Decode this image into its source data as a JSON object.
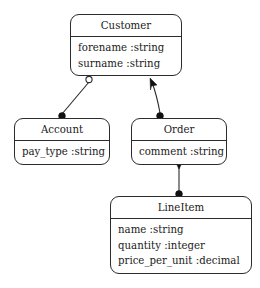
{
  "diagram": {
    "kind": "uml-class-diagram",
    "background_color": "#ffffff",
    "line_color": "#2b2b2b",
    "text_color": "#1a1a1a",
    "classes": [
      {
        "id": "customer",
        "name": "Customer",
        "attributes": [
          "forename :string",
          "surname :string"
        ]
      },
      {
        "id": "account",
        "name": "Account",
        "attributes": [
          "pay_type :string"
        ]
      },
      {
        "id": "order",
        "name": "Order",
        "attributes": [
          "comment :string"
        ]
      },
      {
        "id": "lineitem",
        "name": "LineItem",
        "attributes": [
          "name :string",
          "quantity :integer",
          "price_per_unit :decimal"
        ]
      }
    ],
    "associations": [
      {
        "id": "customer-account",
        "from": "customer",
        "to": "account",
        "from_marker": "hollow-circle",
        "to_marker": "filled-circle"
      },
      {
        "id": "customer-order",
        "from": "customer",
        "to": "order",
        "from_marker": "arrowhead",
        "to_marker": "filled-circle"
      },
      {
        "id": "order-lineitem",
        "from": "order",
        "to": "lineitem",
        "from_marker": "arrowhead",
        "to_marker": "filled-circle"
      }
    ]
  }
}
